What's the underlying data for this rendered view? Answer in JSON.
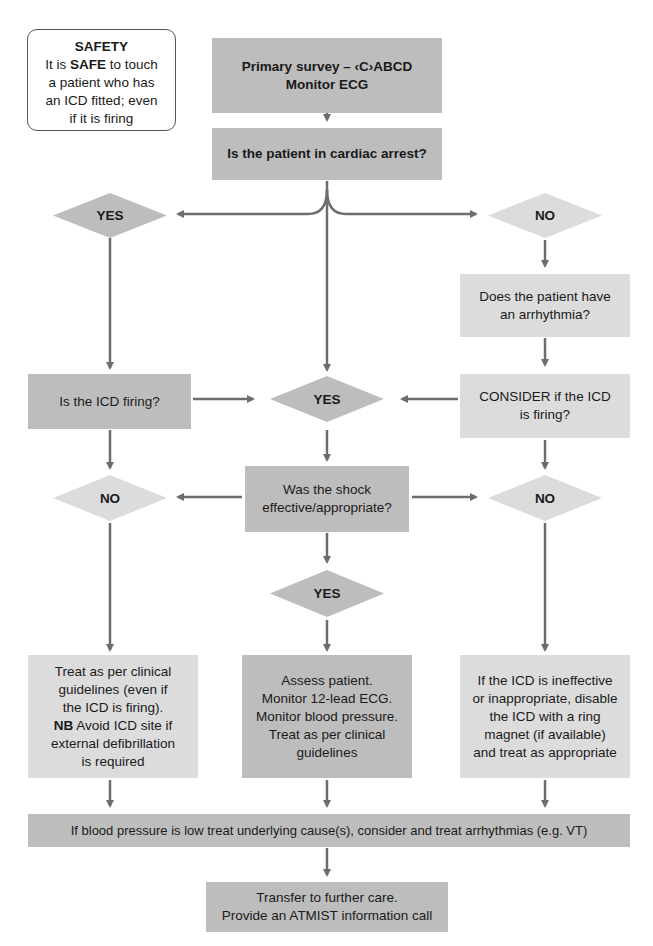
{
  "colors": {
    "dark_fill": "#bdbdbd",
    "light_fill": "#dcdcdc",
    "connector": "#6d6d6d",
    "text": "#1a1a1a"
  },
  "safety": {
    "title": "SAFETY",
    "line1_pre": "It is ",
    "line1_bold": "SAFE",
    "line1_post": " to touch",
    "line2": "a patient who has",
    "line3": "an ICD fitted; even",
    "line4": "if it is firing"
  },
  "nodes": {
    "primary_survey": {
      "line1": "Primary survey – ‹C›ABCD",
      "line2": "Monitor ECG"
    },
    "cardiac_arrest_q": {
      "text": "Is the patient in cardiac arrest?"
    },
    "yes_left": {
      "text": "YES"
    },
    "no_right": {
      "text": "NO"
    },
    "arrhythmia_q": {
      "line1": "Does the patient have",
      "line2": "an arrhythmia?"
    },
    "icd_firing_q": {
      "text": "Is the ICD firing?"
    },
    "yes_center": {
      "text": "YES"
    },
    "consider_icd": {
      "line1": "CONSIDER if the ICD",
      "line2": "is firing?"
    },
    "no_left": {
      "text": "NO"
    },
    "shock_q": {
      "line1": "Was the shock",
      "line2": "effective/appropriate?"
    },
    "no_right2": {
      "text": "NO"
    },
    "yes_center2": {
      "text": "YES"
    },
    "treat_left": {
      "line1": "Treat as per clinical",
      "line2": "guidelines (even if",
      "line3": "the ICD is firing).",
      "line4_bold": "NB",
      "line4_post": " Avoid ICD site if",
      "line5": "external defibrillation",
      "line6": "is required"
    },
    "assess_center": {
      "line1": "Assess patient.",
      "line2": "Monitor 12-lead ECG.",
      "line3": "Monitor blood pressure.",
      "line4": "Treat as per clinical",
      "line5": "guidelines"
    },
    "disable_right": {
      "line1": "If the ICD is ineffective",
      "line2": "or inappropriate, disable",
      "line3": "the ICD with a ring",
      "line4": "magnet (if available)",
      "line5": "and treat as appropriate"
    },
    "bp_low": {
      "text": "If blood pressure is low treat underlying cause(s), consider and treat arrhythmias (e.g. VT)"
    },
    "transfer": {
      "line1": "Transfer to further care.",
      "line2": "Provide an ATMIST information call"
    }
  }
}
